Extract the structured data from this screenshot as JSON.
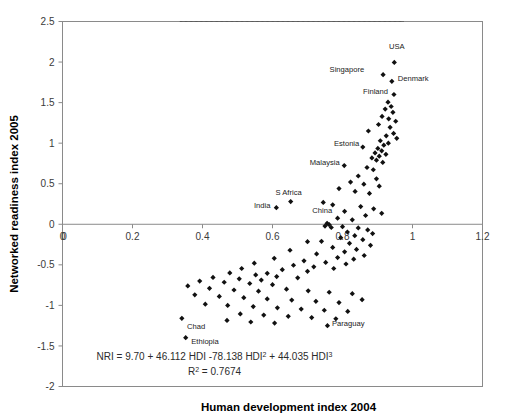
{
  "chart_data": {
    "type": "scatter",
    "title": "",
    "xlabel": "Human development index 2004",
    "ylabel": "Networked readiness index 2005",
    "xlim": [
      0,
      1.2
    ],
    "ylim": [
      -2,
      2.5
    ],
    "xticks": [
      "0",
      "0.2",
      "0.4",
      "0.6",
      "0.8",
      "1",
      "1.2"
    ],
    "xtick_values": [
      0,
      0.2,
      0.4,
      0.6,
      0.8,
      1.0,
      1.2
    ],
    "yticks": [
      "2.5",
      "2",
      "1.5",
      "1",
      "0.5",
      "0",
      "-0.5",
      "-1",
      "-1.5",
      "-2"
    ],
    "ytick_values": [
      2.5,
      2,
      1.5,
      1,
      0.5,
      0,
      -0.5,
      -1,
      -1.5,
      -2
    ],
    "grid": false,
    "legend": "none",
    "origin_label": "0",
    "annotations": {
      "equation_prefix": "NRI = 9.70 + 46.112 HDI -78.138 HDI",
      "equation_sup1": "2",
      "equation_middle": " + 44.035 HDI",
      "equation_sup2": "3",
      "r2_prefix": "R",
      "r2_sup": "2",
      "r2_value": " = 0.7674"
    },
    "fit": {
      "kind": "cubic",
      "label": "NRI = 9.70 + 46.112 HDI -78.138 HDI^2 + 44.035 HDI^3",
      "r_squared": 0.7674,
      "coefficients": [
        9.7,
        46.112,
        -78.138,
        44.035
      ],
      "x_range": [
        0.335,
        0.975
      ]
    },
    "labeled_points": [
      {
        "label": "USA",
        "x": 0.948,
        "y": 1.995,
        "lx": 0.955,
        "ly": 2.195,
        "anchor": "middle"
      },
      {
        "label": "Singapore",
        "x": 0.916,
        "y": 1.845,
        "lx": 0.862,
        "ly": 1.915,
        "anchor": "end"
      },
      {
        "label": "Denmark",
        "x": 0.941,
        "y": 1.762,
        "lx": 0.958,
        "ly": 1.8,
        "anchor": "start"
      },
      {
        "label": "Finland",
        "x": 0.947,
        "y": 1.6,
        "lx": 0.93,
        "ly": 1.64,
        "anchor": "end"
      },
      {
        "label": "Estonia",
        "x": 0.858,
        "y": 0.952,
        "lx": 0.848,
        "ly": 1.0,
        "anchor": "end"
      },
      {
        "label": "Malaysia",
        "x": 0.805,
        "y": 0.724,
        "lx": 0.792,
        "ly": 0.762,
        "anchor": "end"
      },
      {
        "label": "S Africa",
        "x": 0.652,
        "y": 0.28,
        "lx": 0.646,
        "ly": 0.4,
        "anchor": "middle"
      },
      {
        "label": "India",
        "x": 0.611,
        "y": 0.205,
        "lx": 0.594,
        "ly": 0.24,
        "anchor": "end"
      },
      {
        "label": "China",
        "x": 0.756,
        "y": 0.012,
        "lx": 0.742,
        "ly": 0.18,
        "anchor": "middle"
      },
      {
        "label": "Chad",
        "x": 0.341,
        "y": -1.16,
        "lx": 0.356,
        "ly": -1.25,
        "anchor": "start"
      },
      {
        "label": "Ethiopia",
        "x": 0.352,
        "y": -1.398,
        "lx": 0.368,
        "ly": -1.44,
        "anchor": "start"
      },
      {
        "label": "Paraguay",
        "x": 0.757,
        "y": -1.25,
        "lx": 0.77,
        "ly": -1.218,
        "anchor": "start"
      }
    ],
    "points": [
      {
        "x": 0.948,
        "y": 1.995
      },
      {
        "x": 0.916,
        "y": 1.845
      },
      {
        "x": 0.941,
        "y": 1.762
      },
      {
        "x": 0.947,
        "y": 1.6
      },
      {
        "x": 0.93,
        "y": 1.505
      },
      {
        "x": 0.939,
        "y": 1.452
      },
      {
        "x": 0.922,
        "y": 1.42
      },
      {
        "x": 0.944,
        "y": 1.38
      },
      {
        "x": 0.913,
        "y": 1.33
      },
      {
        "x": 0.932,
        "y": 1.3
      },
      {
        "x": 0.952,
        "y": 1.27
      },
      {
        "x": 0.903,
        "y": 1.23
      },
      {
        "x": 0.936,
        "y": 1.195
      },
      {
        "x": 0.874,
        "y": 1.15
      },
      {
        "x": 0.946,
        "y": 1.12
      },
      {
        "x": 0.925,
        "y": 1.09
      },
      {
        "x": 0.955,
        "y": 1.06
      },
      {
        "x": 0.908,
        "y": 1.03
      },
      {
        "x": 0.931,
        "y": 1.0
      },
      {
        "x": 0.918,
        "y": 0.975
      },
      {
        "x": 0.858,
        "y": 0.952
      },
      {
        "x": 0.901,
        "y": 0.935
      },
      {
        "x": 0.912,
        "y": 0.905
      },
      {
        "x": 0.893,
        "y": 0.88
      },
      {
        "x": 0.924,
        "y": 0.862
      },
      {
        "x": 0.905,
        "y": 0.84
      },
      {
        "x": 0.884,
        "y": 0.818
      },
      {
        "x": 0.897,
        "y": 0.79
      },
      {
        "x": 0.915,
        "y": 0.762
      },
      {
        "x": 0.805,
        "y": 0.724
      },
      {
        "x": 0.87,
        "y": 0.7
      },
      {
        "x": 0.888,
        "y": 0.672
      },
      {
        "x": 0.845,
        "y": 0.595
      },
      {
        "x": 0.897,
        "y": 0.56
      },
      {
        "x": 0.823,
        "y": 0.52
      },
      {
        "x": 0.861,
        "y": 0.495
      },
      {
        "x": 0.905,
        "y": 0.47
      },
      {
        "x": 0.79,
        "y": 0.44
      },
      {
        "x": 0.836,
        "y": 0.405
      },
      {
        "x": 0.877,
        "y": 0.38
      },
      {
        "x": 0.652,
        "y": 0.28
      },
      {
        "x": 0.611,
        "y": 0.205
      },
      {
        "x": 0.745,
        "y": 0.27
      },
      {
        "x": 0.772,
        "y": 0.24
      },
      {
        "x": 0.852,
        "y": 0.218
      },
      {
        "x": 0.889,
        "y": 0.19
      },
      {
        "x": 0.806,
        "y": 0.16
      },
      {
        "x": 0.912,
        "y": 0.135
      },
      {
        "x": 0.866,
        "y": 0.108
      },
      {
        "x": 0.786,
        "y": 0.075
      },
      {
        "x": 0.828,
        "y": 0.055
      },
      {
        "x": 0.756,
        "y": 0.012
      },
      {
        "x": 0.762,
        "y": -0.005
      },
      {
        "x": 0.75,
        "y": -0.022
      },
      {
        "x": 0.768,
        "y": -0.04
      },
      {
        "x": 0.8,
        "y": -0.03
      },
      {
        "x": 0.845,
        "y": -0.045
      },
      {
        "x": 0.872,
        "y": -0.07
      },
      {
        "x": 0.814,
        "y": -0.095
      },
      {
        "x": 0.886,
        "y": -0.115
      },
      {
        "x": 0.835,
        "y": -0.14
      },
      {
        "x": 0.795,
        "y": -0.165
      },
      {
        "x": 0.858,
        "y": -0.19
      },
      {
        "x": 0.74,
        "y": -0.21
      },
      {
        "x": 0.82,
        "y": -0.235
      },
      {
        "x": 0.88,
        "y": -0.26
      },
      {
        "x": 0.7,
        "y": -0.215
      },
      {
        "x": 0.772,
        "y": -0.285
      },
      {
        "x": 0.84,
        "y": -0.31
      },
      {
        "x": 0.806,
        "y": -0.34
      },
      {
        "x": 0.726,
        "y": -0.365
      },
      {
        "x": 0.862,
        "y": -0.385
      },
      {
        "x": 0.65,
        "y": -0.32
      },
      {
        "x": 0.786,
        "y": -0.41
      },
      {
        "x": 0.832,
        "y": -0.43
      },
      {
        "x": 0.69,
        "y": -0.45
      },
      {
        "x": 0.752,
        "y": -0.47
      },
      {
        "x": 0.81,
        "y": -0.49
      },
      {
        "x": 0.605,
        "y": -0.42
      },
      {
        "x": 0.66,
        "y": -0.505
      },
      {
        "x": 0.718,
        "y": -0.525
      },
      {
        "x": 0.775,
        "y": -0.545
      },
      {
        "x": 0.548,
        "y": -0.48
      },
      {
        "x": 0.628,
        "y": -0.56
      },
      {
        "x": 0.7,
        "y": -0.58
      },
      {
        "x": 0.585,
        "y": -0.605
      },
      {
        "x": 0.512,
        "y": -0.545
      },
      {
        "x": 0.478,
        "y": -0.6
      },
      {
        "x": 0.552,
        "y": -0.625
      },
      {
        "x": 0.612,
        "y": -0.645
      },
      {
        "x": 0.672,
        "y": -0.66
      },
      {
        "x": 0.43,
        "y": -0.655
      },
      {
        "x": 0.505,
        "y": -0.672
      },
      {
        "x": 0.568,
        "y": -0.688
      },
      {
        "x": 0.392,
        "y": -0.7
      },
      {
        "x": 0.462,
        "y": -0.715
      },
      {
        "x": 0.535,
        "y": -0.73
      },
      {
        "x": 0.6,
        "y": -0.745
      },
      {
        "x": 0.358,
        "y": -0.76
      },
      {
        "x": 0.42,
        "y": -0.79
      },
      {
        "x": 0.49,
        "y": -0.81
      },
      {
        "x": 0.56,
        "y": -0.825
      },
      {
        "x": 0.64,
        "y": -0.8
      },
      {
        "x": 0.702,
        "y": -0.82
      },
      {
        "x": 0.762,
        "y": -0.838
      },
      {
        "x": 0.828,
        "y": -0.855
      },
      {
        "x": 0.378,
        "y": -0.87
      },
      {
        "x": 0.448,
        "y": -0.89
      },
      {
        "x": 0.518,
        "y": -0.905
      },
      {
        "x": 0.585,
        "y": -0.92
      },
      {
        "x": 0.655,
        "y": -0.935
      },
      {
        "x": 0.724,
        "y": -0.95
      },
      {
        "x": 0.79,
        "y": -0.965
      },
      {
        "x": 0.856,
        "y": -0.93
      },
      {
        "x": 0.408,
        "y": -0.985
      },
      {
        "x": 0.472,
        "y": -1.0
      },
      {
        "x": 0.545,
        "y": -1.015
      },
      {
        "x": 0.614,
        "y": -1.03
      },
      {
        "x": 0.682,
        "y": -1.045
      },
      {
        "x": 0.748,
        "y": -1.06
      },
      {
        "x": 0.815,
        "y": -1.075
      },
      {
        "x": 0.508,
        "y": -1.105
      },
      {
        "x": 0.575,
        "y": -1.12
      },
      {
        "x": 0.645,
        "y": -1.135
      },
      {
        "x": 0.712,
        "y": -1.15
      },
      {
        "x": 0.781,
        "y": -1.165
      },
      {
        "x": 0.341,
        "y": -1.16
      },
      {
        "x": 0.352,
        "y": -1.398
      },
      {
        "x": 0.757,
        "y": -1.25
      },
      {
        "x": 0.47,
        "y": -1.185
      },
      {
        "x": 0.538,
        "y": -1.205
      },
      {
        "x": 0.606,
        "y": -1.218
      }
    ]
  }
}
